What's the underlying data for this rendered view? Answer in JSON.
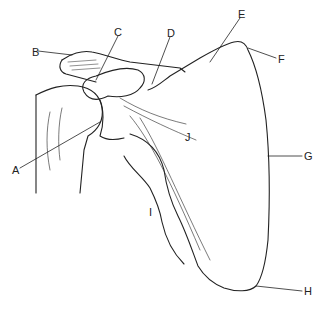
{
  "diagram": {
    "labels": [
      {
        "id": "A",
        "text": "A",
        "x": 12,
        "y": 165
      },
      {
        "id": "B",
        "text": "B",
        "x": 32,
        "y": 51
      },
      {
        "id": "C",
        "text": "C",
        "x": 114,
        "y": 28
      },
      {
        "id": "D",
        "text": "D",
        "x": 167,
        "y": 29
      },
      {
        "id": "E",
        "text": "E",
        "x": 238,
        "y": 10
      },
      {
        "id": "F",
        "text": "F",
        "x": 278,
        "y": 55
      },
      {
        "id": "G",
        "text": "G",
        "x": 304,
        "y": 153
      },
      {
        "id": "H",
        "text": "H",
        "x": 304,
        "y": 288
      },
      {
        "id": "I",
        "text": "I",
        "x": 149,
        "y": 208
      },
      {
        "id": "J",
        "text": "J",
        "x": 185,
        "y": 132
      }
    ]
  }
}
